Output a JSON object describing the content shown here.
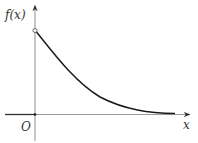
{
  "diagram": {
    "type": "function-graph",
    "labels": {
      "y_axis": "f(x)",
      "x_axis": "x",
      "origin": "O"
    },
    "features": {
      "start_point": "open-circle-on-y-axis",
      "asymptote": "x-axis",
      "trend": "decreasing"
    },
    "colors": {
      "axis": "#9a9a9a",
      "curve": "#1a1a1a",
      "text": "#333333",
      "background": "#ffffff"
    }
  }
}
